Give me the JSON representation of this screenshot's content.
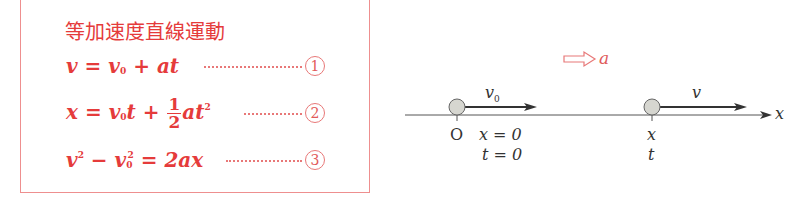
{
  "panel": {
    "title": "等加速度直線運動",
    "equations": [
      {
        "id": "1",
        "lhs": "v",
        "text": "v = v0 + at",
        "number": "1"
      },
      {
        "id": "2",
        "lhs": "x",
        "text": "x = v0 t + (1/2) a t^2",
        "number": "2"
      },
      {
        "id": "3",
        "lhs": "v^2 - v0^2",
        "text": "v^2 - v0^2 = 2ax",
        "number": "3"
      }
    ],
    "eq1": {
      "v": "v",
      "eq": " = ",
      "v0": "v",
      "sub0": "0",
      "plus": " + ",
      "at": "at"
    },
    "eq2": {
      "x": "x",
      "eq": " = ",
      "v0": "v",
      "sub0": "0",
      "t": "t",
      "plus": " + ",
      "num": "1",
      "den": "2",
      "at": "at",
      "sq": "2"
    },
    "eq3": {
      "v": "v",
      "sq1": "2",
      "minus": " − ",
      "v0": "v",
      "sub0": "0",
      "sq2": "2",
      "eq": " = ",
      "rhs": "2ax"
    },
    "circled": [
      "1",
      "2",
      "3"
    ]
  },
  "diagram": {
    "acceleration_label": "a",
    "axis_label": "x",
    "start": {
      "velocity_label": "v",
      "velocity_sub": "0",
      "origin_label": "O",
      "x_label": "x = 0",
      "t_label": "t = 0"
    },
    "end": {
      "velocity_label": "v",
      "x_label": "x",
      "t_label": "t"
    },
    "colors": {
      "accent": "#e53b3b",
      "ink": "#333333",
      "ball": "#d6d6d0"
    }
  }
}
